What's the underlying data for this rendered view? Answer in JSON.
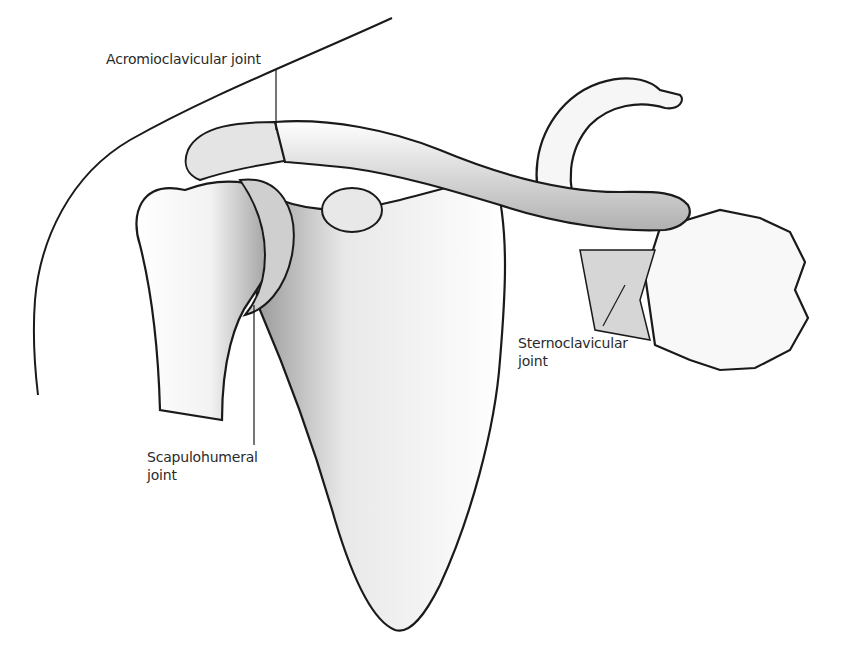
{
  "figure": {
    "labels": {
      "acromioclavicular": {
        "text": "Acromioclavicular joint"
      },
      "sternoclavicular": {
        "line1": "Sternoclavicular",
        "line2": "joint"
      },
      "scapulohumeral": {
        "line1": "Scapulohumeral",
        "line2": "joint"
      }
    },
    "structures": [
      "clavicle",
      "scapula",
      "humerus head",
      "coracoid process",
      "sternum (manubrium)",
      "first rib",
      "body outline"
    ],
    "colors": {
      "ink": "#1a1a1a",
      "bone_fill": "#f4f4f4",
      "shade": "#b8b8b8",
      "background": "#ffffff"
    }
  }
}
